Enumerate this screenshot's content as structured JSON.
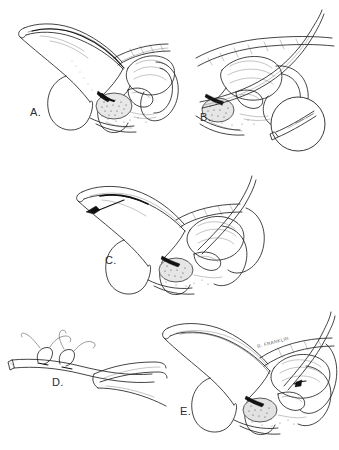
{
  "figure": {
    "style": "black-and-white pen-and-ink medical line illustration with stippled shading",
    "background_color": "#ffffff",
    "ink_color": "#222222",
    "signature": "R. FRANKLIN",
    "panel_count": 5
  },
  "panels": [
    {
      "id": "A",
      "label": "A.",
      "label_x": 30,
      "label_y": 112,
      "view": "male pelvis, midsagittal section",
      "description": "Sagittal section of the male pelvis showing the penis, urethra, bladder, prostate and rectum with a catheter passed along the urethra.",
      "structures": [
        "penis",
        "urethra",
        "bladder",
        "prostate",
        "rectum",
        "pubic symphysis",
        "scrotum"
      ],
      "has_inset": false,
      "has_arrow": false
    },
    {
      "id": "B",
      "label": "B.",
      "label_x": 200,
      "label_y": 117,
      "view": "male pelvis, midsagittal section",
      "description": "Same sagittal view with an instrument advanced through the urethra to the prostatic apex; a circular magnified inset details the instrument tip.",
      "structures": [
        "urethra",
        "bladder",
        "prostate",
        "rectum",
        "instrument"
      ],
      "has_inset": true,
      "inset": {
        "shape": "circle",
        "center_x": 297,
        "center_y": 124,
        "radius": 27,
        "description": "Magnified detail of the catheter / sound tip with suture passing through the eyelet."
      },
      "has_arrow": false
    },
    {
      "id": "C",
      "label": "C.",
      "label_x": 105,
      "label_y": 262,
      "view": "male pelvis, midsagittal section",
      "description": "Traction applied to the catheter; a solid black arrow indicates the direction of pull along the penile shaft.",
      "structures": [
        "penis",
        "urethra",
        "bladder",
        "prostate",
        "rectum",
        "catheter"
      ],
      "has_inset": false,
      "has_arrow": true,
      "arrow": {
        "direction": "left",
        "tip_x": 92,
        "tip_y": 213,
        "tail_x": 137,
        "tail_y": 200,
        "meaning": "direction of traction"
      }
    },
    {
      "id": "D",
      "label": "D.",
      "label_x": 52,
      "label_y": 382,
      "view": "close-up detail",
      "description": "Close-up of sutures knotted around the catheter shaft while held with a clamp / forceps.",
      "structures": [
        "catheter",
        "suture knots",
        "suture tails",
        "forceps"
      ],
      "has_inset": false,
      "has_arrow": false
    },
    {
      "id": "E",
      "label": "E.",
      "label_x": 180,
      "label_y": 412,
      "view": "male pelvis, midsagittal section",
      "description": "Final position with the catheter seated and the suture secured; artist signature appears above the bladder.",
      "structures": [
        "penis",
        "urethra",
        "bladder",
        "prostate",
        "rectum",
        "catheter",
        "suture"
      ],
      "has_inset": false,
      "has_arrow": false,
      "has_signature": true,
      "signature_x": 258,
      "signature_y": 348
    }
  ]
}
